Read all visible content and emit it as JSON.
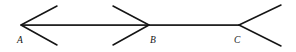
{
  "figure": {
    "background_color": "#ffffff",
    "stroke_color": "#151515",
    "width": 296,
    "height": 52,
    "baseline": {
      "name": "horizontal-baseline",
      "y": 25,
      "x_start": 21,
      "x_end": 239
    },
    "vertices": [
      {
        "id": "A",
        "label": "A",
        "x": 21,
        "y": 25,
        "fin_direction": "opens-right",
        "label_x": 17,
        "label_y": 35
      },
      {
        "id": "B",
        "label": "B",
        "x": 149,
        "y": 25,
        "fin_direction": "opens-left",
        "label_x": 150,
        "label_y": 35
      },
      {
        "id": "C",
        "label": "C",
        "x": 239,
        "y": 25,
        "fin_direction": "opens-right",
        "label_x": 234,
        "label_y": 35
      }
    ],
    "fins": [
      {
        "name": "fin-a-upper",
        "x1": 21,
        "y1": 25,
        "x2": 57,
        "y2": 6
      },
      {
        "name": "fin-a-lower",
        "x1": 21,
        "y1": 25,
        "x2": 57,
        "y2": 45
      },
      {
        "name": "fin-b-upper",
        "x1": 149,
        "y1": 25,
        "x2": 113,
        "y2": 6
      },
      {
        "name": "fin-b-lower",
        "x1": 149,
        "y1": 25,
        "x2": 113,
        "y2": 45
      },
      {
        "name": "fin-c-upper",
        "x1": 239,
        "y1": 25,
        "x2": 281,
        "y2": 5
      },
      {
        "name": "fin-c-lower",
        "x1": 239,
        "y1": 25,
        "x2": 281,
        "y2": 46
      }
    ],
    "segments": [
      {
        "name": "segment-ab",
        "from": "A",
        "to": "B",
        "x1": 21,
        "y1": 25,
        "x2": 149,
        "y2": 25
      },
      {
        "name": "segment-bc",
        "from": "B",
        "to": "C",
        "x1": 149,
        "y1": 25,
        "x2": 239,
        "y2": 25
      }
    ]
  }
}
